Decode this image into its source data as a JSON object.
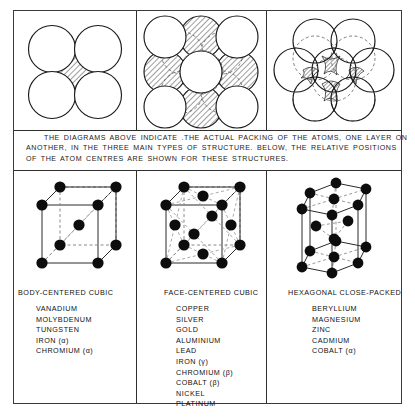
{
  "figure": {
    "caption_lines": [
      "THE  DIAGRAMS ABOVE INDICATE .THE ACTUAL PACKING OF THE ATOMS,  ONE LAYER ON",
      "ANOTHER, IN  THE  THREE  MAIN  TYPES OF STRUCTURE.     BELOW,  THE  RELATIVE POSITIONS",
      "OF  THE  ATOM  CENTRES  ARE  SHOWN  FOR  THESE  STRUCTURES."
    ]
  },
  "columns": [
    {
      "id": "body-centered-cubic",
      "heading": "BODY-CENTERED  CUBIC",
      "packing_label": "bcc-packing-diagram",
      "lattice_label": "bcc-lattice-diagram",
      "metals": [
        "VANADIUM",
        "MOLYBDENUM",
        "TUNGSTEN",
        "IRON (α)",
        "CHROMIUM (α)"
      ]
    },
    {
      "id": "face-centered-cubic",
      "heading": "FACE-CENTERED  CUBIC",
      "packing_label": "fcc-packing-diagram",
      "lattice_label": "fcc-lattice-diagram",
      "metals": [
        "COPPER",
        "SILVER",
        "GOLD",
        "ALUMINIUM",
        "LEAD",
        "IRON (γ)",
        "CHROMIUM (β)",
        "COBALT (β)",
        "NICKEL",
        "PLATINUM"
      ]
    },
    {
      "id": "hexagonal-close-packed",
      "heading": "HEXAGONAL CLOSE-PACKED",
      "packing_label": "hcp-packing-diagram",
      "lattice_label": "hcp-lattice-diagram",
      "metals": [
        "BERYLLIUM",
        "MAGNESIUM",
        "ZINC",
        "CADMIUM",
        "COBALT (α)"
      ]
    }
  ],
  "style": {
    "ink": "#1a1a1a",
    "paper": "#ffffff",
    "atom_fill": "#0d0d0d",
    "hatch_fill": "#555555"
  }
}
